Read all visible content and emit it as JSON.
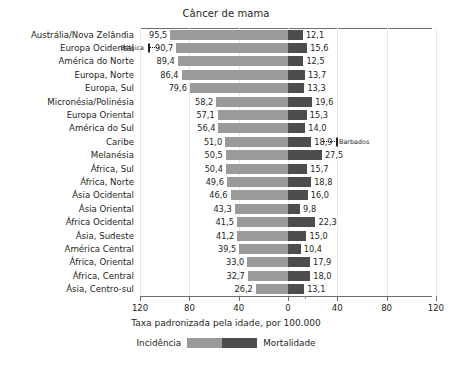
{
  "chart_data": {
    "type": "bar",
    "subtype": "diverging-horizontal",
    "title": "Câncer de mama",
    "xlabel": "Taxa padronizada pela idade, por 100.000",
    "ylabel": "",
    "grid": true,
    "legend_position": "bottom",
    "axis": {
      "tick_labels": [
        "120",
        "80",
        "40",
        "0",
        "40",
        "80",
        "120"
      ],
      "tick_values": [
        -120,
        -80,
        -40,
        0,
        40,
        80,
        120
      ],
      "xlim": [
        -128,
        140
      ],
      "unit": "por 100.000"
    },
    "categories": [
      "Austrália/Nova Zelândia",
      "Europa Ocidental",
      "América do Norte",
      "Europa, Norte",
      "Europa, Sul",
      "Micronésia/Polinésia",
      "Europa Oriental",
      "América do Sul",
      "Caribe",
      "Melanésia",
      "África, Sul",
      "África, Norte",
      "Ásia Ocidental",
      "Ásia Oriental",
      "África Ocidental",
      "Ásia, Sudeste",
      "América Central",
      "África, Oriental",
      "África, Central",
      "Ásia, Centro-sul"
    ],
    "series": [
      {
        "name": "Incidência",
        "color": "#9a9a9a",
        "direction": "left",
        "values": [
          95.5,
          90.7,
          89.4,
          86.4,
          79.6,
          58.2,
          57.1,
          56.4,
          51.0,
          50.5,
          50.4,
          49.6,
          46.6,
          43.3,
          41.5,
          41.2,
          39.5,
          33.0,
          32.7,
          26.2
        ],
        "labels": [
          "95,5",
          "90,7",
          "89,4",
          "86,4",
          "79,6",
          "58,2",
          "57,1",
          "56,4",
          "51,0",
          "50,5",
          "50,4",
          "49,6",
          "46,6",
          "43,3",
          "41,5",
          "41,2",
          "39,5",
          "33,0",
          "32,7",
          "26,2"
        ]
      },
      {
        "name": "Mortalidade",
        "color": "#4d4d4d",
        "direction": "right",
        "values": [
          12.1,
          15.6,
          12.5,
          13.7,
          13.3,
          19.6,
          15.3,
          14.0,
          18.9,
          27.5,
          15.7,
          18.8,
          16.0,
          9.8,
          22.3,
          15.0,
          10.4,
          17.9,
          18.0,
          13.1
        ],
        "labels": [
          "12,1",
          "15,6",
          "12,5",
          "13,7",
          "13,3",
          "19,6",
          "15,3",
          "14,0",
          "18,9",
          "27,5",
          "15,7",
          "18,8",
          "16,0",
          "9,8",
          "22,3",
          "15,0",
          "10,4",
          "17,9",
          "18,0",
          "13,1"
        ]
      }
    ],
    "annotations": [
      {
        "label": "Bélgica",
        "row": 1,
        "side": "left",
        "value": 113.2,
        "marker": "tick-with-dotted-leader"
      },
      {
        "label": "Barbados",
        "row": 8,
        "side": "right",
        "value": 39.0,
        "marker": "tick-with-dotted-leader"
      }
    ],
    "legend": [
      {
        "label": "Incidência",
        "color": "#9a9a9a"
      },
      {
        "label": "Mortalidade",
        "color": "#4d4d4d"
      }
    ]
  },
  "colors": {
    "incidence": "#9a9a9a",
    "mortality": "#4d4d4d",
    "axis": "#6e6e6e",
    "text": "#231f20",
    "grid": "#e9e9e9"
  }
}
